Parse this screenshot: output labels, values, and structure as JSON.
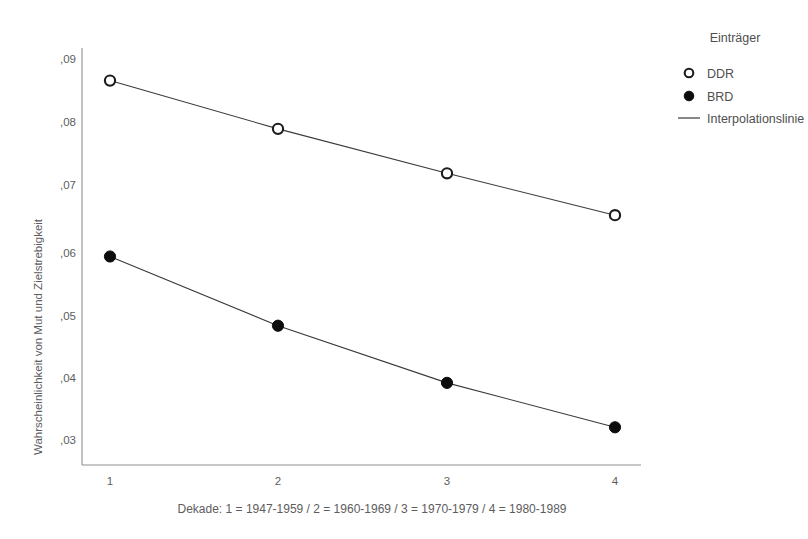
{
  "chart_data": {
    "type": "line",
    "title": "",
    "subtitle": "",
    "xlabel": "Dekade: 1 = 1947-1959 / 2 = 1960-1969 / 3 = 1970-1979 / 4 = 1980-1989",
    "ylabel": "Wahrscheinlichkeit von Mut und Zielstrebigkeit",
    "x": [
      1,
      2,
      3,
      4
    ],
    "categories": [
      "1",
      "2",
      "3",
      "4"
    ],
    "xticklabels": [
      "1",
      "2",
      "3",
      "4"
    ],
    "yticklabels": [
      ",09",
      ",08",
      ",07",
      ",06",
      ",05",
      ",04",
      ",03"
    ],
    "ytickvalues": [
      0.09,
      0.08,
      0.07,
      0.06,
      0.05,
      0.04,
      0.03
    ],
    "ylim": [
      0.0275,
      0.0925
    ],
    "xlim": [
      0.72,
      4.22
    ],
    "grid": false,
    "legend_position": "right-top",
    "series": [
      {
        "name": "DDR",
        "marker": "open-circle",
        "values": [
          0.0866,
          0.079,
          0.072,
          0.0654
        ]
      },
      {
        "name": "BRD",
        "marker": "filled-circle",
        "values": [
          0.0589,
          0.048,
          0.039,
          0.032
        ]
      }
    ]
  },
  "legend": {
    "title": "Einträger",
    "items": [
      {
        "label": "DDR",
        "symbol": "open-circle"
      },
      {
        "label": "BRD",
        "symbol": "filled-circle"
      },
      {
        "label": "Interpolationslinie",
        "symbol": "line"
      }
    ]
  },
  "axes": {
    "y_title": "Wahrscheinlichkeit von Mut und Zielstrebigkeit",
    "x_caption": "Dekade: 1 = 1947-1959 / 2 = 1960-1969 / 3 = 1970-1979 / 4 = 1980-1989",
    "y_ticks": [
      ",09",
      ",08",
      ",07",
      ",06",
      ",05",
      ",04",
      ",03"
    ],
    "x_ticks": [
      "1",
      "2",
      "3",
      "4"
    ]
  },
  "colors": {
    "background": "#ffffff",
    "axis": "#8f8f8f",
    "line": "#3a3a3a",
    "marker_fill": "#0d0d0d",
    "marker_open_fill": "#ffffff",
    "text": "#5d5d5d"
  }
}
